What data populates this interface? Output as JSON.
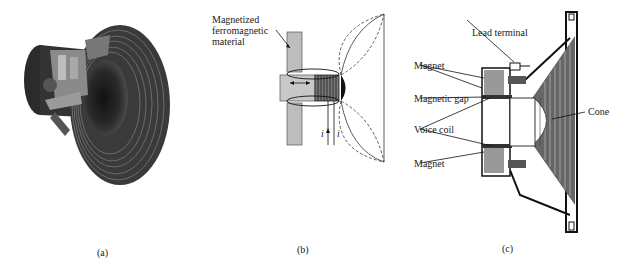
{
  "figure": {
    "panels": [
      {
        "id": "a",
        "caption": "(a)",
        "description": "cutaway-speaker-illustration"
      },
      {
        "id": "b",
        "caption": "(b)",
        "labels": {
          "material_line1": "Magnetized",
          "material_line2": "ferromagnetic",
          "material_line3": "material",
          "current_left": "i",
          "current_right": "i"
        }
      },
      {
        "id": "c",
        "caption": "(c)",
        "labels": {
          "lead_terminal": "Lead terminal",
          "magnet_top": "Magnet",
          "magnetic_gap": "Magnetic gap",
          "voice_coil": "Voice coil",
          "magnet_bottom": "Magnet",
          "cone": "Cone"
        }
      }
    ]
  }
}
